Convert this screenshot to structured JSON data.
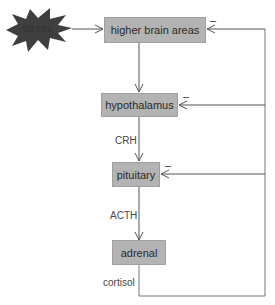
{
  "diagram": {
    "stress": "stress",
    "nodes": {
      "higher": "higher brain areas",
      "hypothalamus": "hypothalamus",
      "pituitary": "pituitary",
      "adrenal": "adrenal"
    },
    "edges": {
      "crh": "CRH",
      "acth": "ACTH",
      "cortisol": "cortisol"
    },
    "inhibition_sign": "–",
    "colors": {
      "box": "#b3b3b3",
      "stress": "#3f3f3f",
      "line": "#555555"
    }
  }
}
